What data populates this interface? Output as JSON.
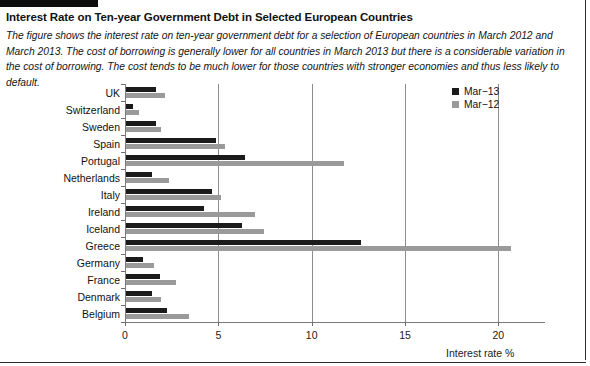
{
  "figure": {
    "title": "Interest Rate on Ten-year Government Debt in Selected European Countries",
    "caption": "The figure shows the interest rate on ten-year government debt for a selection of European countries in March 2012 and March 2013. The cost of borrowing is generally lower for all countries in March 2013 but there is a considerable variation in the cost of borrowing. The cost tends to be much lower for those countries with stronger economies and thus less likely to default."
  },
  "colors": {
    "mar13": "#1b1b1b",
    "mar12": "#9a9a9a",
    "axis": "#7b7b7b",
    "grid": "#8d8d8d",
    "text": "#111111"
  },
  "legend": {
    "position": "top-right",
    "entries": [
      {
        "label": "Mar−13",
        "color": "#1b1b1b",
        "swatch": "square-swatch"
      },
      {
        "label": "Mar−12",
        "color": "#9a9a9a",
        "swatch": "square-swatch"
      }
    ]
  },
  "chart_data": {
    "type": "bar",
    "orientation": "horizontal",
    "title": "Interest Rate on Ten-year Government Debt in Selected European Countries",
    "xlabel": "Interest rate %",
    "ylabel": "",
    "xlim": [
      0,
      22.5
    ],
    "ticks": [
      0,
      5,
      10,
      15,
      20
    ],
    "ticklabels": [
      "0",
      "5",
      "10",
      "15",
      "20"
    ],
    "grid": "vertical-at-major-ticks",
    "categories": [
      "UK",
      "Switzerland",
      "Sweden",
      "Spain",
      "Portugal",
      "Netherlands",
      "Italy",
      "Ireland",
      "Iceland",
      "Greece",
      "Germany",
      "France",
      "Denmark",
      "Belgium"
    ],
    "series": [
      {
        "name": "Mar−13",
        "color": "#1b1b1b",
        "values": [
          1.6,
          0.4,
          1.6,
          4.8,
          6.4,
          1.4,
          4.6,
          4.2,
          6.2,
          12.6,
          0.9,
          1.8,
          1.4,
          2.2
        ]
      },
      {
        "name": "Mar−12",
        "color": "#9a9a9a",
        "values": [
          2.1,
          0.7,
          1.9,
          5.3,
          11.7,
          2.3,
          5.1,
          6.9,
          7.4,
          20.6,
          1.5,
          2.7,
          1.9,
          3.4
        ]
      }
    ]
  }
}
